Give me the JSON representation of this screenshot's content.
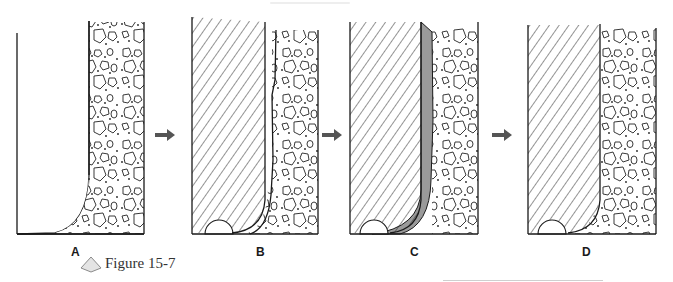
{
  "figure": {
    "caption": "Figure 15-7",
    "caption_icon": "diamond-icon",
    "panels": [
      {
        "id": "A",
        "label": "A",
        "description": "empty trench with rock rubble wall on right"
      },
      {
        "id": "B",
        "label": "B",
        "description": "hatched fill with semicircle at base, rubble on right"
      },
      {
        "id": "C",
        "label": "C",
        "description": "hatched fill with gray layer between fill and rubble"
      },
      {
        "id": "D",
        "label": "D",
        "description": "hatched fill directly against rubble"
      }
    ],
    "arrows": [
      {
        "from": "A",
        "to": "B",
        "icon": "arrow-right-icon"
      },
      {
        "from": "B",
        "to": "C",
        "icon": "arrow-right-icon"
      },
      {
        "from": "C",
        "to": "D",
        "icon": "arrow-right-icon"
      }
    ],
    "colors": {
      "line": "#1a1a1a",
      "hatch": "#2a2a2a",
      "layer_gray": "#9a9a9a",
      "arrow": "#555555",
      "caption_diamond": "#e4e4e4"
    }
  }
}
